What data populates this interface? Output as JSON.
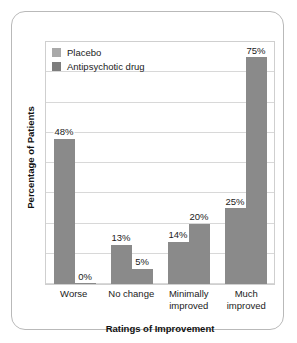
{
  "chart_data": {
    "type": "bar",
    "title": "",
    "subtitle": "",
    "xlabel": "Ratings of Improvement",
    "ylabel": "Percentage of Patients",
    "categories": [
      "Worse",
      "No change",
      "Minimally improved",
      "Much improved"
    ],
    "category_lines": [
      [
        "Worse"
      ],
      [
        "No change"
      ],
      [
        "Minimally",
        "improved"
      ],
      [
        "Much",
        "improved"
      ]
    ],
    "series": [
      {
        "name": "Placebo",
        "color": "#8a8a8a",
        "legend_swatch_color": "#a9a9a9",
        "values": [
          48,
          13,
          14,
          25
        ],
        "labels": [
          "48%",
          "13%",
          "14%",
          "25%"
        ]
      },
      {
        "name": "Antipsychotic drug",
        "color": "#8a8a8a",
        "legend_swatch_color": "#7d7d7d",
        "values": [
          0,
          5,
          20,
          75
        ],
        "labels": [
          "0%",
          "5%",
          "20%",
          "75%"
        ]
      }
    ],
    "ylim": [
      0,
      80
    ],
    "ytick_interval": 10,
    "ytick_labels_visible": false,
    "grid": true,
    "grid_color": "#d8d8d8",
    "legend_position": "top-left",
    "plot_border_color": "#cfcfcf",
    "frame_border_color": "#b9b9b9",
    "background_color": "#ffffff",
    "text_color": "#1b1b1b"
  }
}
